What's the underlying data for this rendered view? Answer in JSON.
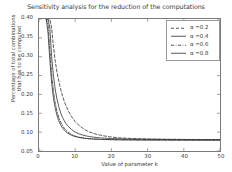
{
  "chart_data": {
    "type": "line",
    "title": "Sensitivity analysis for the reduction of the computations",
    "xlabel": "Value of parameter k",
    "ylabel_line1": "Percentage of total combinations",
    "ylabel_line2": "that has to be computed",
    "xlim": [
      0,
      50
    ],
    "ylim": [
      0.05,
      0.4
    ],
    "xticks": [
      0,
      10,
      20,
      30,
      40,
      50
    ],
    "xtick_labels": [
      "0",
      "10",
      "20",
      "30",
      "40",
      "50"
    ],
    "yticks": [
      0.05,
      0.1,
      0.15,
      0.2,
      0.25,
      0.3,
      0.35,
      0.4
    ],
    "ytick_labels": [
      "0.05",
      "0.10",
      "0.15",
      "0.20",
      "0.25",
      "0.30",
      "0.35",
      "0.40"
    ],
    "grid": false,
    "legend_position": "upper right",
    "line_color": "#3a3a3a",
    "axis_color": "#7a7a7a",
    "x": [
      2,
      2.5,
      3,
      3.5,
      4,
      4.5,
      5,
      5.5,
      6,
      6.5,
      7,
      7.5,
      8,
      9,
      10,
      11,
      12,
      13,
      14,
      15,
      16,
      17,
      18,
      20,
      22,
      25,
      28,
      31,
      35,
      40,
      45,
      50
    ],
    "series": [
      {
        "name": "α =0.2",
        "dash": "dashed",
        "values": [
          0.4,
          0.4,
          0.4,
          0.375,
          0.325,
          0.287,
          0.258,
          0.234,
          0.213,
          0.196,
          0.181,
          0.169,
          0.158,
          0.141,
          0.128,
          0.118,
          0.111,
          0.105,
          0.1,
          0.097,
          0.094,
          0.092,
          0.09,
          0.087,
          0.085,
          0.0835,
          0.0825,
          0.0818,
          0.0812,
          0.0807,
          0.0804,
          0.0802
        ]
      },
      {
        "name": "α =0.4",
        "dash": "solid",
        "values": [
          0.4,
          0.4,
          0.375,
          0.3,
          0.248,
          0.212,
          0.186,
          0.166,
          0.151,
          0.139,
          0.13,
          0.122,
          0.116,
          0.107,
          0.1,
          0.0957,
          0.0925,
          0.09,
          0.0882,
          0.0868,
          0.0857,
          0.0848,
          0.0841,
          0.083,
          0.0823,
          0.0816,
          0.0811,
          0.0808,
          0.0805,
          0.0802,
          0.0801,
          0.08
        ]
      },
      {
        "name": "α =0.6",
        "dash": "dashdot",
        "values": [
          0.4,
          0.385,
          0.318,
          0.252,
          0.207,
          0.176,
          0.154,
          0.138,
          0.126,
          0.117,
          0.11,
          0.104,
          0.0998,
          0.0936,
          0.0895,
          0.0868,
          0.0849,
          0.0835,
          0.0825,
          0.0818,
          0.0812,
          0.0808,
          0.0805,
          0.08,
          0.0797,
          0.0794,
          0.0792,
          0.0791,
          0.079,
          0.0789,
          0.0788,
          0.0788
        ]
      },
      {
        "name": "α =0.8",
        "dash": "solid",
        "values": [
          0.4,
          0.362,
          0.29,
          0.23,
          0.19,
          0.163,
          0.143,
          0.129,
          0.119,
          0.111,
          0.105,
          0.1004,
          0.0968,
          0.0917,
          0.0883,
          0.086,
          0.0844,
          0.0833,
          0.0824,
          0.0818,
          0.0813,
          0.0809,
          0.0806,
          0.0802,
          0.0799,
          0.0796,
          0.0794,
          0.0793,
          0.0792,
          0.0791,
          0.079,
          0.079
        ]
      }
    ]
  },
  "legend": {
    "items": [
      {
        "label": "α =0.2"
      },
      {
        "label": "α =0.4"
      },
      {
        "label": "α =0.6"
      },
      {
        "label": "α =0.8"
      }
    ]
  }
}
